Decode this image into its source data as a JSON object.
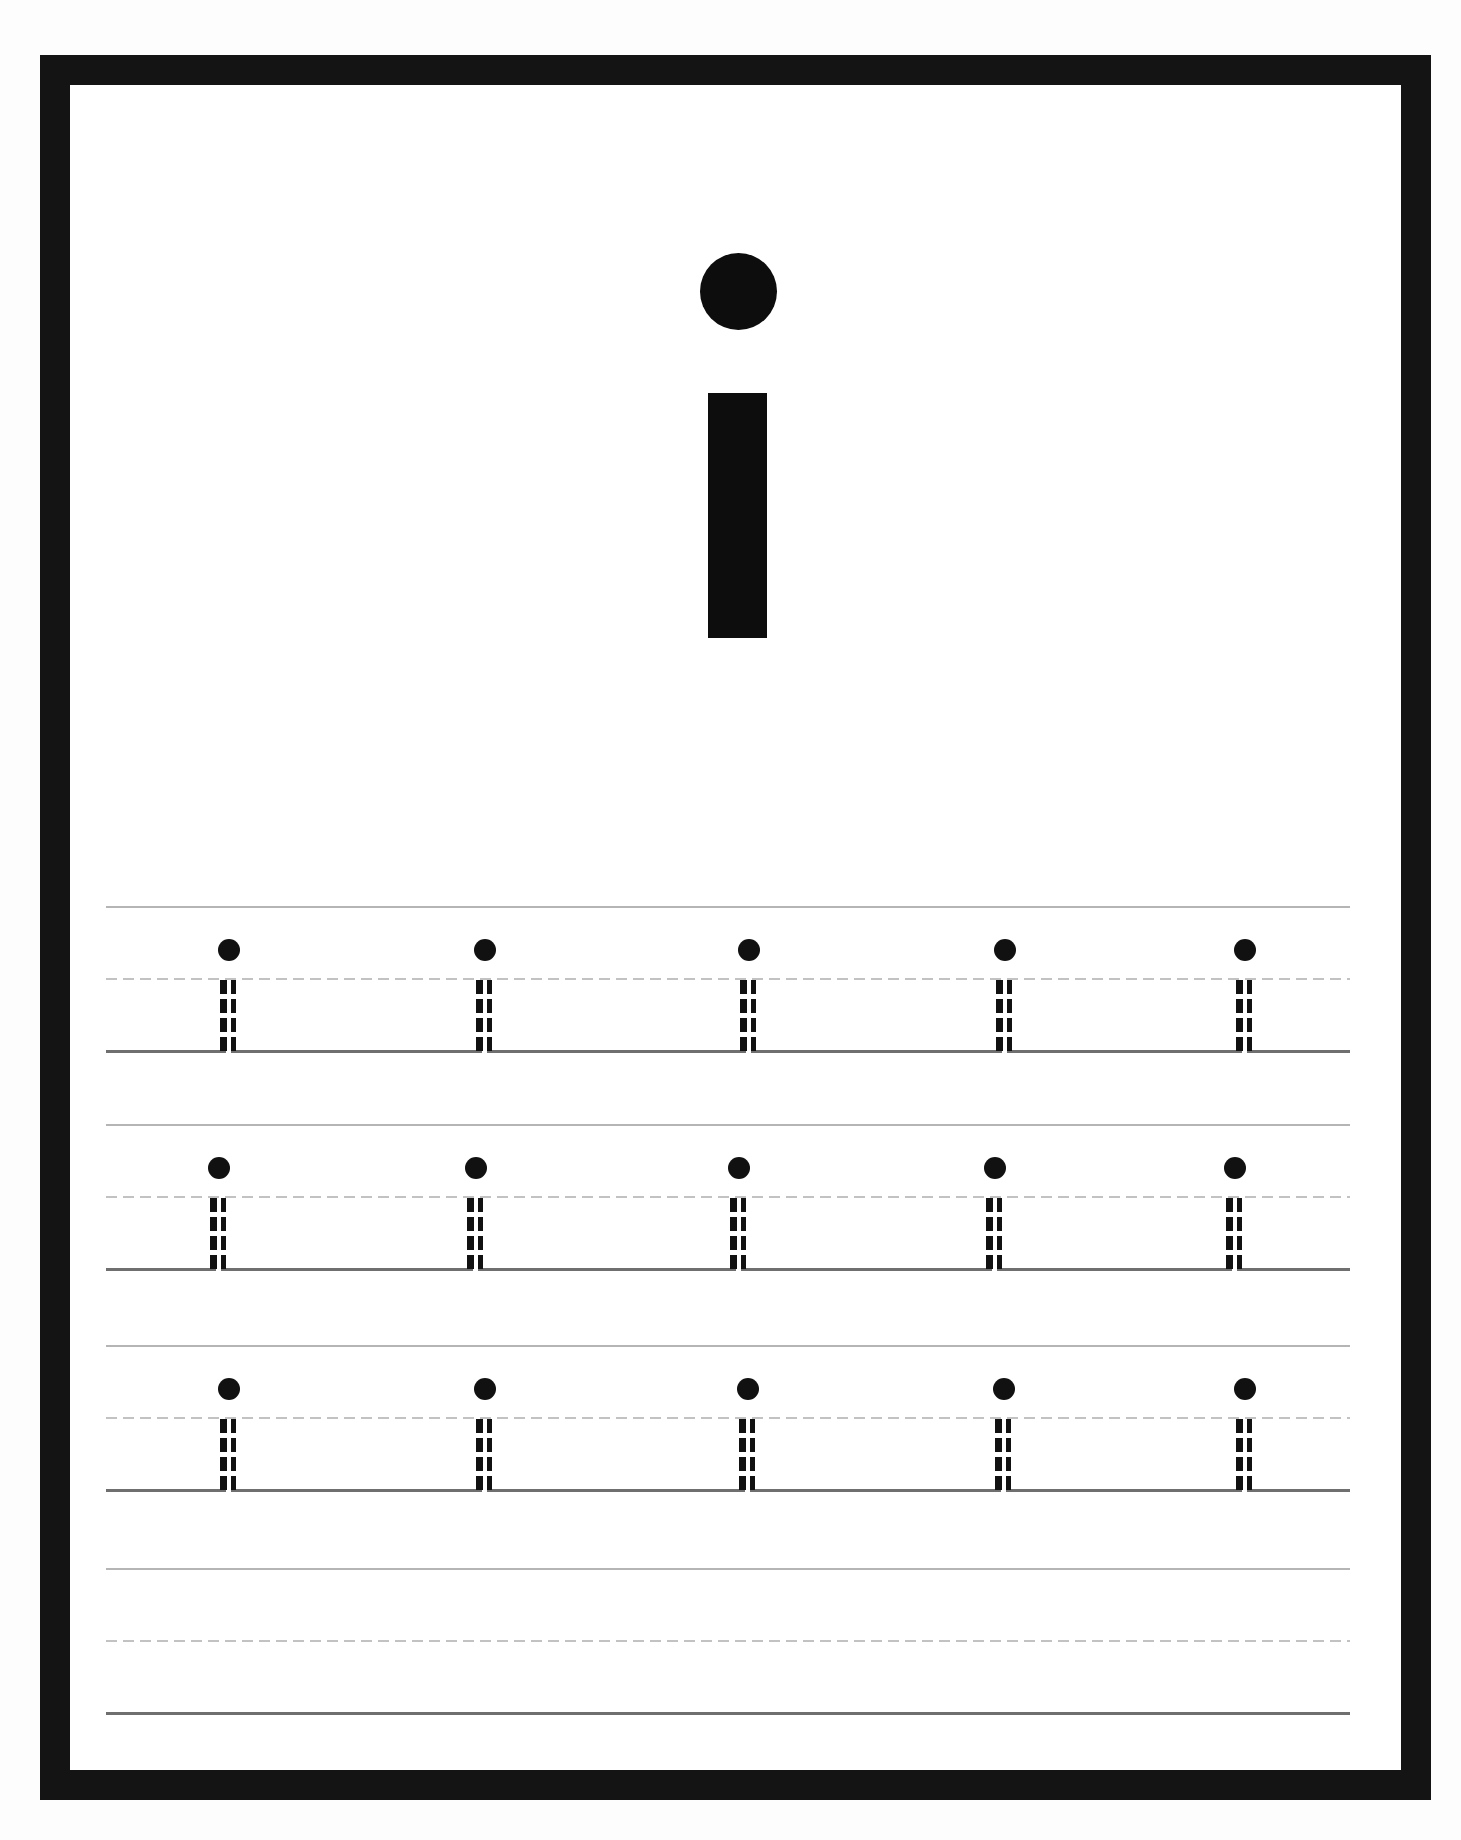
{
  "worksheet": {
    "title_letter": "i",
    "letter_case": "lowercase",
    "colors": {
      "border": "#141414",
      "letter": "#0d0d0d",
      "top_line": "#b5b5b5",
      "mid_dashed_line": "#c2c2c2",
      "baseline": "#6f6f6f"
    },
    "rows": [
      {
        "label": "row-1",
        "top": 906,
        "guides": [
          229,
          485,
          749,
          1005,
          1245
        ]
      },
      {
        "label": "row-2",
        "top": 1124,
        "guides": [
          219,
          476,
          739,
          995,
          1235
        ]
      },
      {
        "label": "row-3",
        "top": 1345,
        "guides": [
          229,
          485,
          748,
          1004,
          1245
        ]
      },
      {
        "label": "row-4",
        "top": 1568,
        "guides": []
      }
    ],
    "guide_letter": "i",
    "guides_per_row": 5,
    "traceable_rows": 3,
    "blank_practice_rows": 1
  }
}
